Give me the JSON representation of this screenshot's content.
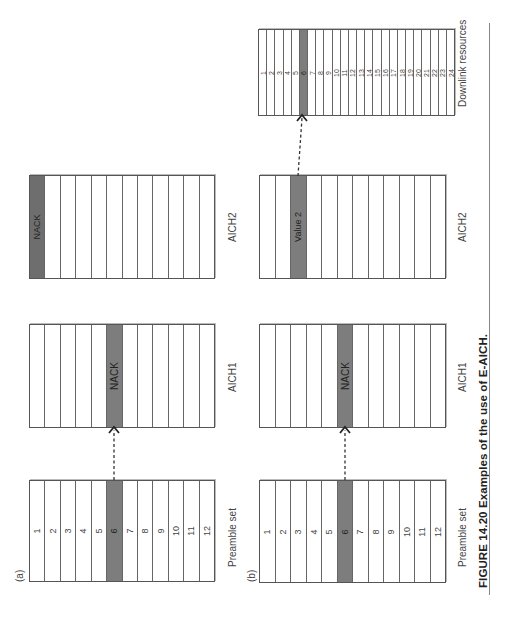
{
  "figure": {
    "caption": "FIGURE 14.20  Examples of the use of E-AICH.",
    "panels": [
      {
        "id": "a",
        "label": "(a)",
        "preamble_set": {
          "label": "Preamble set",
          "cells": [
            "1",
            "2",
            "3",
            "4",
            "5",
            "6",
            "7",
            "8",
            "9",
            "10",
            "11",
            "12"
          ],
          "highlighted_index": 6
        },
        "aich1": {
          "label": "AICH1",
          "highlighted_index": 6,
          "highlighted_text": "NACK"
        },
        "aich2": {
          "label": "AICH2",
          "highlighted_index": 1,
          "highlighted_text": "NACK"
        },
        "arrows": [
          {
            "from": "preamble_set cell 6",
            "to": "aich1 cell 6"
          }
        ]
      },
      {
        "id": "b",
        "label": "(b)",
        "preamble_set": {
          "label": "Preamble set",
          "cells": [
            "1",
            "2",
            "3",
            "4",
            "5",
            "6",
            "7",
            "8",
            "9",
            "10",
            "11",
            "12"
          ],
          "highlighted_index": 6
        },
        "aich1": {
          "label": "AICH1",
          "highlighted_index": 6,
          "highlighted_text": "NACK"
        },
        "aich2": {
          "label": "AICH2",
          "highlighted_index": 3,
          "highlighted_text": "Value 2"
        },
        "downlink_resources": {
          "label": "Downlink resources",
          "cells": [
            "1",
            "2",
            "3",
            "4",
            "5",
            "6",
            "7",
            "8",
            "9",
            "10",
            "11",
            "12",
            "13",
            "14",
            "15",
            "16",
            "17",
            "18",
            "19",
            "20",
            "21",
            "22",
            "23",
            "24"
          ],
          "highlighted_index": 6
        },
        "arrows": [
          {
            "from": "preamble_set cell 6",
            "to": "aich1 cell 6"
          },
          {
            "from": "aich2 cell 3",
            "to": "downlink_resources cell 6"
          }
        ]
      }
    ],
    "colors": {
      "shaded_cell": "#7d7d7d",
      "border": "#555555",
      "rule": "#888888"
    }
  }
}
